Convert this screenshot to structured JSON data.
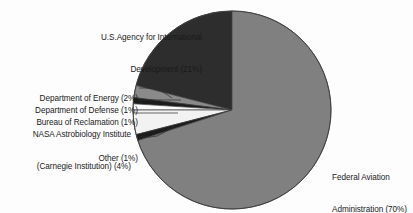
{
  "chart_data": {
    "type": "pie",
    "title": "",
    "subtitle": "",
    "xlabel": "",
    "ylabel": "",
    "legend_position": "callout-labels",
    "grid": false,
    "start_angle_deg": 90,
    "direction": "counterclockwise",
    "categories": [
      "Federal Aviation Administration",
      "U.S.Agency for International Development",
      "NASA Astrobiology Institute (Carnegie Institution)",
      "Department of Energy",
      "Department of Defense",
      "Bureau of Reclamation",
      "Other"
    ],
    "values": [
      70,
      21,
      4,
      2,
      1,
      1,
      1
    ],
    "slices": [
      {
        "name": "usaid",
        "label_line1": "U.S.Agency for International",
        "label_line2": "Development (21%)",
        "label_text": "U.S.Agency for International Development (21%)",
        "value": 21,
        "percent": "21%",
        "color": "#2d2d2d"
      },
      {
        "name": "department-of-energy",
        "label_line1": "Department of Energy (2%)",
        "label_line2": "",
        "label_text": "Department of Energy (2%)",
        "value": 2,
        "percent": "2%",
        "color": "#8a8a8a"
      },
      {
        "name": "department-of-defense",
        "label_line1": "Department of Defense (1%)",
        "label_line2": "",
        "label_text": "Department of Defense (1%)",
        "value": 1,
        "percent": "1%",
        "color": "#1c1c1c"
      },
      {
        "name": "bureau-of-reclamation",
        "label_line1": "Bureau of Reclamation (1%)",
        "label_line2": "",
        "label_text": "Bureau of Reclamation (1%)",
        "value": 1,
        "percent": "1%",
        "color": "#fbfbfb"
      },
      {
        "name": "nasa-astrobiology-institute",
        "label_line1": "NASA Astrobiology Institute",
        "label_line2": "(Carnegie Institution) (4%)",
        "label_text": "NASA Astrobiology Institute (Carnegie Institution) (4%)",
        "value": 4,
        "percent": "4%",
        "color": "#f2f2f2"
      },
      {
        "name": "other",
        "label_line1": "Other (1%)",
        "label_line2": "",
        "label_text": "Other (1%)",
        "value": 1,
        "percent": "1%",
        "color": "#1c1c1c"
      },
      {
        "name": "federal-aviation-administration",
        "label_line1": "Federal Aviation",
        "label_line2": "Administration (70%)",
        "label_text": "Federal Aviation Administration (70%)",
        "value": 70,
        "percent": "70%",
        "color": "#808080"
      }
    ],
    "total": 100,
    "units": "percent"
  },
  "colors": {
    "background": "#fdfdfd",
    "text": "#1a1a1a",
    "outline": "#4a4a4a",
    "leader_line": "#2b2b2b"
  }
}
